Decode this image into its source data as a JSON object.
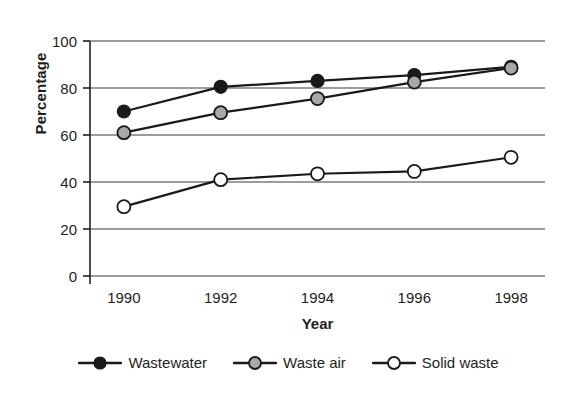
{
  "chart_data": {
    "type": "line",
    "title": "",
    "xlabel": "Year",
    "ylabel": "Percentage",
    "categories": [
      "1990",
      "1992",
      "1994",
      "1996",
      "1998"
    ],
    "x": [
      1990,
      1992,
      1994,
      1996,
      1998
    ],
    "xlim": [
      1989.3,
      1998.7
    ],
    "ylim": [
      0,
      100
    ],
    "yticks": [
      0,
      20,
      40,
      60,
      80,
      100
    ],
    "ytick_labels": [
      "0",
      "20",
      "40",
      "60",
      "80",
      "100"
    ],
    "grid": "horizontal",
    "legend_position": "bottom",
    "series": [
      {
        "name": "Wastewater",
        "marker": "filled-circle",
        "marker_color": "#1a1a1a",
        "line_color": "#1a1a1a",
        "values": [
          70,
          80.5,
          83,
          85.5,
          89
        ]
      },
      {
        "name": "Waste air",
        "marker": "gray-circle",
        "marker_color": "#a8a8a8",
        "line_color": "#1a1a1a",
        "values": [
          61,
          69.5,
          75.5,
          82.5,
          88.5
        ]
      },
      {
        "name": "Solid waste",
        "marker": "open-circle",
        "marker_color": "#ffffff",
        "line_color": "#1a1a1a",
        "values": [
          29.5,
          41,
          43.5,
          44.5,
          50.5
        ]
      }
    ]
  },
  "axis": {
    "y_title": "Percentage",
    "x_title": "Year"
  },
  "colors": {
    "axis": "#231f20",
    "grid": "#3a3a3a",
    "line": "#1a1a1a",
    "marker_filled": "#1a1a1a",
    "marker_gray": "#a8a8a8",
    "marker_open": "#ffffff",
    "background": "#ffffff"
  }
}
